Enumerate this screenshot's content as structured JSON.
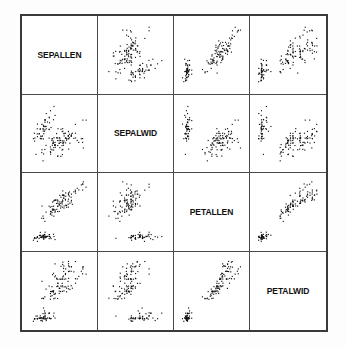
{
  "figure": {
    "kind": "scatterplot-matrix",
    "variables": [
      "SEPALLEN",
      "SEPALWID",
      "PETALLEN",
      "PETALWID"
    ],
    "point_color": "#111111",
    "border_color": "#3a3a3a",
    "grid_color": "#4a4a4a",
    "background_color": "#ffffff"
  },
  "labels": {
    "d0": "SEPALLEN",
    "d1": "SEPALWID",
    "d2": "PETALLEN",
    "d3": "PETALWID"
  },
  "chart_data": {
    "type": "scatter",
    "title": "",
    "subtitle": "",
    "xlabel": "",
    "ylabel": "",
    "grid": false,
    "legend": "none",
    "layout": "scatterplot-matrix 4x4, diagonal shows variable name",
    "variables": [
      "SEPALLEN",
      "SEPALWID",
      "PETALLEN",
      "PETALWID"
    ],
    "axis_ranges": {
      "SEPALLEN": [
        4.0,
        8.2
      ],
      "SEPALWID": [
        1.8,
        4.6
      ],
      "PETALLEN": [
        0.8,
        7.1
      ],
      "PETALWID": [
        0.0,
        2.6
      ]
    },
    "n_points": 150,
    "columns": [
      "SEPALLEN",
      "SEPALWID",
      "PETALLEN",
      "PETALWID"
    ],
    "rows": [
      [
        5.1,
        3.5,
        1.4,
        0.2
      ],
      [
        4.9,
        3.0,
        1.4,
        0.2
      ],
      [
        4.7,
        3.2,
        1.3,
        0.2
      ],
      [
        4.6,
        3.1,
        1.5,
        0.2
      ],
      [
        5.0,
        3.6,
        1.4,
        0.2
      ],
      [
        5.4,
        3.9,
        1.7,
        0.4
      ],
      [
        4.6,
        3.4,
        1.4,
        0.3
      ],
      [
        5.0,
        3.4,
        1.5,
        0.2
      ],
      [
        4.4,
        2.9,
        1.4,
        0.2
      ],
      [
        4.9,
        3.1,
        1.5,
        0.1
      ],
      [
        5.4,
        3.7,
        1.5,
        0.2
      ],
      [
        4.8,
        3.4,
        1.6,
        0.2
      ],
      [
        4.8,
        3.0,
        1.4,
        0.1
      ],
      [
        4.3,
        3.0,
        1.1,
        0.1
      ],
      [
        5.8,
        4.0,
        1.2,
        0.2
      ],
      [
        5.7,
        4.4,
        1.5,
        0.4
      ],
      [
        5.4,
        3.9,
        1.3,
        0.4
      ],
      [
        5.1,
        3.5,
        1.4,
        0.3
      ],
      [
        5.7,
        3.8,
        1.7,
        0.3
      ],
      [
        5.1,
        3.8,
        1.5,
        0.3
      ],
      [
        5.4,
        3.4,
        1.7,
        0.2
      ],
      [
        5.1,
        3.7,
        1.5,
        0.4
      ],
      [
        4.6,
        3.6,
        1.0,
        0.2
      ],
      [
        5.1,
        3.3,
        1.7,
        0.5
      ],
      [
        4.8,
        3.4,
        1.9,
        0.2
      ],
      [
        5.0,
        3.0,
        1.6,
        0.2
      ],
      [
        5.0,
        3.4,
        1.6,
        0.4
      ],
      [
        5.2,
        3.5,
        1.5,
        0.2
      ],
      [
        5.2,
        3.4,
        1.4,
        0.2
      ],
      [
        4.7,
        3.2,
        1.6,
        0.2
      ],
      [
        4.8,
        3.1,
        1.6,
        0.2
      ],
      [
        5.4,
        3.4,
        1.5,
        0.4
      ],
      [
        5.2,
        4.1,
        1.5,
        0.1
      ],
      [
        5.5,
        4.2,
        1.4,
        0.2
      ],
      [
        4.9,
        3.1,
        1.5,
        0.2
      ],
      [
        5.0,
        3.2,
        1.2,
        0.2
      ],
      [
        5.5,
        3.5,
        1.3,
        0.2
      ],
      [
        4.9,
        3.6,
        1.4,
        0.1
      ],
      [
        4.4,
        3.0,
        1.3,
        0.2
      ],
      [
        5.1,
        3.4,
        1.5,
        0.2
      ],
      [
        5.0,
        3.5,
        1.3,
        0.3
      ],
      [
        4.5,
        2.3,
        1.3,
        0.3
      ],
      [
        4.4,
        3.2,
        1.3,
        0.2
      ],
      [
        5.0,
        3.5,
        1.6,
        0.6
      ],
      [
        5.1,
        3.8,
        1.9,
        0.4
      ],
      [
        4.8,
        3.0,
        1.4,
        0.3
      ],
      [
        5.1,
        3.8,
        1.6,
        0.2
      ],
      [
        4.6,
        3.2,
        1.4,
        0.2
      ],
      [
        5.3,
        3.7,
        1.5,
        0.2
      ],
      [
        5.0,
        3.3,
        1.4,
        0.2
      ],
      [
        7.0,
        3.2,
        4.7,
        1.4
      ],
      [
        6.4,
        3.2,
        4.5,
        1.5
      ],
      [
        6.9,
        3.1,
        4.9,
        1.5
      ],
      [
        5.5,
        2.3,
        4.0,
        1.3
      ],
      [
        6.5,
        2.8,
        4.6,
        1.5
      ],
      [
        5.7,
        2.8,
        4.5,
        1.3
      ],
      [
        6.3,
        3.3,
        4.7,
        1.6
      ],
      [
        4.9,
        2.4,
        3.3,
        1.0
      ],
      [
        6.6,
        2.9,
        4.6,
        1.3
      ],
      [
        5.2,
        2.7,
        3.9,
        1.4
      ],
      [
        5.0,
        2.0,
        3.5,
        1.0
      ],
      [
        5.9,
        3.0,
        4.2,
        1.5
      ],
      [
        6.0,
        2.2,
        4.0,
        1.0
      ],
      [
        6.1,
        2.9,
        4.7,
        1.4
      ],
      [
        5.6,
        2.9,
        3.6,
        1.3
      ],
      [
        6.7,
        3.1,
        4.4,
        1.4
      ],
      [
        5.6,
        3.0,
        4.5,
        1.5
      ],
      [
        5.8,
        2.7,
        4.1,
        1.0
      ],
      [
        6.2,
        2.2,
        4.5,
        1.5
      ],
      [
        5.6,
        2.5,
        3.9,
        1.1
      ],
      [
        5.9,
        3.2,
        4.8,
        1.8
      ],
      [
        6.1,
        2.8,
        4.0,
        1.3
      ],
      [
        6.3,
        2.5,
        4.9,
        1.5
      ],
      [
        6.1,
        2.8,
        4.7,
        1.2
      ],
      [
        6.4,
        2.9,
        4.3,
        1.3
      ],
      [
        6.6,
        3.0,
        4.4,
        1.4
      ],
      [
        6.8,
        2.8,
        4.8,
        1.4
      ],
      [
        6.7,
        3.0,
        5.0,
        1.7
      ],
      [
        6.0,
        2.9,
        4.5,
        1.5
      ],
      [
        5.7,
        2.6,
        3.5,
        1.0
      ],
      [
        5.5,
        2.4,
        3.8,
        1.1
      ],
      [
        5.5,
        2.4,
        3.7,
        1.0
      ],
      [
        5.8,
        2.7,
        3.9,
        1.2
      ],
      [
        6.0,
        2.7,
        5.1,
        1.6
      ],
      [
        5.4,
        3.0,
        4.5,
        1.5
      ],
      [
        6.0,
        3.4,
        4.5,
        1.6
      ],
      [
        6.7,
        3.1,
        4.7,
        1.5
      ],
      [
        6.3,
        2.3,
        4.4,
        1.3
      ],
      [
        5.6,
        3.0,
        4.1,
        1.3
      ],
      [
        5.5,
        2.5,
        4.0,
        1.3
      ],
      [
        5.5,
        2.6,
        4.4,
        1.2
      ],
      [
        6.1,
        3.0,
        4.6,
        1.4
      ],
      [
        5.8,
        2.6,
        4.0,
        1.2
      ],
      [
        5.0,
        2.3,
        3.3,
        1.0
      ],
      [
        5.6,
        2.7,
        4.2,
        1.3
      ],
      [
        5.7,
        3.0,
        4.2,
        1.2
      ],
      [
        5.7,
        2.9,
        4.2,
        1.3
      ],
      [
        6.2,
        2.9,
        4.3,
        1.3
      ],
      [
        5.1,
        2.5,
        3.0,
        1.1
      ],
      [
        5.7,
        2.8,
        4.1,
        1.3
      ],
      [
        6.3,
        3.3,
        6.0,
        2.5
      ],
      [
        5.8,
        2.7,
        5.1,
        1.9
      ],
      [
        7.1,
        3.0,
        5.9,
        2.1
      ],
      [
        6.3,
        2.9,
        5.6,
        1.8
      ],
      [
        6.5,
        3.0,
        5.8,
        2.2
      ],
      [
        7.6,
        3.0,
        6.6,
        2.1
      ],
      [
        4.9,
        2.5,
        4.5,
        1.7
      ],
      [
        7.3,
        2.9,
        6.3,
        1.8
      ],
      [
        6.7,
        2.5,
        5.8,
        1.8
      ],
      [
        7.2,
        3.6,
        6.1,
        2.5
      ],
      [
        6.5,
        3.2,
        5.1,
        2.0
      ],
      [
        6.4,
        2.7,
        5.3,
        1.9
      ],
      [
        6.8,
        3.0,
        5.5,
        2.1
      ],
      [
        5.7,
        2.5,
        5.0,
        2.0
      ],
      [
        5.8,
        2.8,
        5.1,
        2.4
      ],
      [
        6.4,
        3.2,
        5.3,
        2.3
      ],
      [
        6.5,
        3.0,
        5.5,
        1.8
      ],
      [
        7.7,
        3.8,
        6.7,
        2.2
      ],
      [
        7.7,
        2.6,
        6.9,
        2.3
      ],
      [
        6.0,
        2.2,
        5.0,
        1.5
      ],
      [
        6.9,
        3.2,
        5.7,
        2.3
      ],
      [
        5.6,
        2.8,
        4.9,
        2.0
      ],
      [
        7.7,
        2.8,
        6.7,
        2.0
      ],
      [
        6.3,
        2.7,
        4.9,
        1.8
      ],
      [
        6.7,
        3.3,
        5.7,
        2.1
      ],
      [
        7.2,
        3.2,
        6.0,
        1.8
      ],
      [
        6.2,
        2.8,
        4.8,
        1.8
      ],
      [
        6.1,
        3.0,
        4.9,
        1.8
      ],
      [
        6.4,
        2.8,
        5.6,
        2.1
      ],
      [
        7.2,
        3.0,
        5.8,
        1.6
      ],
      [
        7.4,
        2.8,
        6.1,
        1.9
      ],
      [
        7.9,
        3.8,
        6.4,
        2.0
      ],
      [
        6.4,
        2.8,
        5.6,
        2.2
      ],
      [
        6.3,
        2.8,
        5.1,
        1.5
      ],
      [
        6.1,
        2.6,
        5.6,
        1.4
      ],
      [
        7.7,
        3.0,
        6.1,
        2.3
      ],
      [
        6.3,
        3.4,
        5.6,
        2.4
      ],
      [
        6.4,
        3.1,
        5.5,
        1.8
      ],
      [
        6.0,
        3.0,
        4.8,
        1.8
      ],
      [
        6.9,
        3.1,
        5.4,
        2.1
      ],
      [
        6.7,
        3.1,
        5.6,
        2.4
      ],
      [
        6.9,
        3.1,
        5.1,
        2.3
      ],
      [
        5.8,
        2.7,
        5.1,
        1.9
      ],
      [
        6.8,
        3.2,
        5.9,
        2.3
      ],
      [
        6.7,
        3.3,
        5.7,
        2.5
      ],
      [
        6.7,
        3.0,
        5.2,
        2.3
      ],
      [
        6.3,
        2.5,
        5.0,
        1.9
      ],
      [
        6.5,
        3.0,
        5.2,
        2.0
      ],
      [
        6.2,
        3.4,
        5.4,
        2.3
      ],
      [
        5.9,
        3.0,
        5.1,
        1.8
      ]
    ]
  }
}
